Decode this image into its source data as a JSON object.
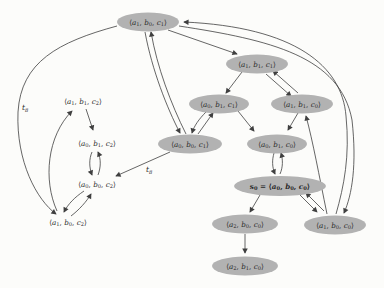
{
  "figure": {
    "type": "state-transition-graph",
    "background": "#fcfcfa",
    "ink": "#3f3f3f",
    "node_fill": "#b2b2b2",
    "node_text_color": "#2a2a2a",
    "bracket_open": "⟨",
    "bracket_close": "⟩",
    "separator": ", "
  },
  "graph": {
    "nodes": [
      {
        "id": "a1b0c1",
        "x": 148,
        "y": 22,
        "shape": "ellipse",
        "rx": 31,
        "ry": 9.5,
        "triple": [
          [
            "a",
            "1"
          ],
          [
            "b",
            "0"
          ],
          [
            "c",
            "1"
          ]
        ]
      },
      {
        "id": "a1b1c1",
        "x": 257,
        "y": 64,
        "shape": "ellipse",
        "rx": 31,
        "ry": 9.5,
        "triple": [
          [
            "a",
            "1"
          ],
          [
            "b",
            "1"
          ],
          [
            "c",
            "1"
          ]
        ]
      },
      {
        "id": "a0b1c1",
        "x": 219,
        "y": 104,
        "shape": "ellipse",
        "rx": 30,
        "ry": 9.5,
        "triple": [
          [
            "a",
            "0"
          ],
          [
            "b",
            "1"
          ],
          [
            "c",
            "1"
          ]
        ]
      },
      {
        "id": "a1b1c0",
        "x": 302,
        "y": 104,
        "shape": "ellipse",
        "rx": 31,
        "ry": 9.5,
        "triple": [
          [
            "a",
            "1"
          ],
          [
            "b",
            "1"
          ],
          [
            "c",
            "0"
          ]
        ]
      },
      {
        "id": "a0b0c1",
        "x": 190,
        "y": 144,
        "shape": "ellipse",
        "rx": 32,
        "ry": 9.5,
        "triple": [
          [
            "a",
            "0"
          ],
          [
            "b",
            "0"
          ],
          [
            "c",
            "1"
          ]
        ]
      },
      {
        "id": "a0b1c0",
        "x": 277,
        "y": 144,
        "shape": "ellipse",
        "rx": 30,
        "ry": 9.5,
        "triple": [
          [
            "a",
            "0"
          ],
          [
            "b",
            "1"
          ],
          [
            "c",
            "0"
          ]
        ]
      },
      {
        "id": "s0",
        "x": 280,
        "y": 186,
        "shape": "ellipse",
        "rx": 46,
        "ry": 10,
        "bold": true,
        "prefix": [
          "s",
          "0"
        ],
        "equals": " = ",
        "triple": [
          [
            "a",
            "0"
          ],
          [
            "b",
            "0"
          ],
          [
            "c",
            "0"
          ]
        ]
      },
      {
        "id": "a2b0c0",
        "x": 245,
        "y": 224,
        "shape": "ellipse",
        "rx": 33,
        "ry": 9.5,
        "triple": [
          [
            "a",
            "2"
          ],
          [
            "b",
            "0"
          ],
          [
            "c",
            "0"
          ]
        ]
      },
      {
        "id": "a1b0c0",
        "x": 335,
        "y": 225,
        "shape": "ellipse",
        "rx": 31,
        "ry": 9.5,
        "triple": [
          [
            "a",
            "1"
          ],
          [
            "b",
            "0"
          ],
          [
            "c",
            "0"
          ]
        ]
      },
      {
        "id": "a2b1c0",
        "x": 245,
        "y": 266,
        "shape": "ellipse",
        "rx": 33,
        "ry": 9.5,
        "triple": [
          [
            "a",
            "2"
          ],
          [
            "b",
            "1"
          ],
          [
            "c",
            "0"
          ]
        ]
      },
      {
        "id": "a1b1c2",
        "x": 83,
        "y": 101,
        "shape": "text",
        "triple": [
          [
            "a",
            "1"
          ],
          [
            "b",
            "1"
          ],
          [
            "c",
            "2"
          ]
        ]
      },
      {
        "id": "a0b1c2",
        "x": 97,
        "y": 143,
        "shape": "text",
        "triple": [
          [
            "a",
            "0"
          ],
          [
            "b",
            "1"
          ],
          [
            "c",
            "2"
          ]
        ]
      },
      {
        "id": "a0b0c2",
        "x": 97,
        "y": 184,
        "shape": "text",
        "triple": [
          [
            "a",
            "0"
          ],
          [
            "b",
            "0"
          ],
          [
            "c",
            "2"
          ]
        ]
      },
      {
        "id": "a1b0c2",
        "x": 68,
        "y": 222,
        "shape": "text",
        "triple": [
          [
            "a",
            "1"
          ],
          [
            "b",
            "0"
          ],
          [
            "c",
            "2"
          ]
        ]
      }
    ],
    "edges": [
      {
        "name": "a1b0c1-to-a1b1c1",
        "d": "M168,30 L237,54"
      },
      {
        "name": "a1b1c1-to-a0b1c1",
        "d": "M242,72 L226,93"
      },
      {
        "name": "a1b1c1-to-a1b1c0",
        "d": "M266,74 L291,96"
      },
      {
        "name": "a1b1c0-to-a1b1c1",
        "d": "M298,93 L273,71"
      },
      {
        "name": "a0b1c1-to-a0b0c1",
        "d": "M206,112 C199,119 194,126 192,133"
      },
      {
        "name": "a0b0c1-to-a0b1c1",
        "d": "M198,134 C203,127 208,120 213,113"
      },
      {
        "name": "a0b1c1-to-a0b1c0",
        "d": "M238,111 L254,131"
      },
      {
        "name": "a1b1c0-to-a0b1c0",
        "d": "M298,113 L288,130"
      },
      {
        "name": "a1b0c1-to-a0b0c1",
        "d": "M145,32 C152,70 167,108 180,133"
      },
      {
        "name": "a0b0c1-to-a1b0c1",
        "d": "M186,134 C171,104 157,67 151,32"
      },
      {
        "name": "a0b0c1-to-a0b0c2",
        "d": "M170,152 L116,176"
      },
      {
        "name": "a0b1c0-to-s0",
        "d": "M274,153 C272,160 272,167 275,174"
      },
      {
        "name": "s0-to-a0b1c0",
        "d": "M280,174 C283,167 283,160 281,153"
      },
      {
        "name": "s0-to-a1b0c0",
        "d": "M299,194 L317,212"
      },
      {
        "name": "a1b0c0-to-s0",
        "d": "M324,211 L306,193"
      },
      {
        "name": "s0-to-a2b0c0",
        "d": "M260,195 L250,212"
      },
      {
        "name": "a2b0c0-to-a2b1c0",
        "d": "M245,234 L245,253"
      },
      {
        "name": "a1b0c0-to-a1b1c0",
        "d": "M327,214 C319,175 313,142 306,116"
      },
      {
        "name": "a1b0c1-to-a1b0c0",
        "d": "M179,26 C270,40 340,56 352,120 C357,165 352,195 344,213"
      },
      {
        "name": "a1b0c0-to-a1b0c1",
        "d": "M336,214 C344,186 350,156 346,116 C342,66 295,27 184,22"
      },
      {
        "name": "a1b0c1-to-a1b0c2",
        "d": "M117,26 C58,42 21,62 18,112 C16,162 37,200 56,214"
      },
      {
        "name": "a1b0c2-to-a1b1c2",
        "d": "M57,211 C43,180 47,136 72,111"
      },
      {
        "name": "a1b1c2-to-a0b1c2",
        "d": "M86,109 L93,130"
      },
      {
        "name": "a0b1c2-to-a0b0c2",
        "d": "M92,152 C89,159 89,167 92,175"
      },
      {
        "name": "a0b0c2-to-a0b1c2",
        "d": "M98,175 C101,167 101,159 98,152"
      },
      {
        "name": "a0b0c2-to-a1b0c2",
        "d": "M84,191 C75,197 68,204 64,212"
      },
      {
        "name": "a1b0c2-to-a0b0c2",
        "d": "M71,216 C79,210 87,201 91,194"
      }
    ],
    "edge_labels": [
      {
        "t": "t",
        "s": "8",
        "x": 22,
        "y": 110
      },
      {
        "t": "t",
        "s": "8",
        "x": 146,
        "y": 172
      }
    ]
  }
}
